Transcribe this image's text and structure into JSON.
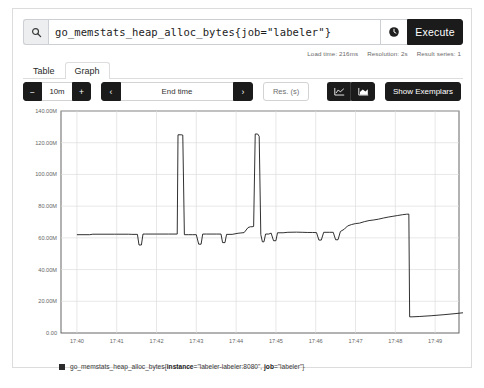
{
  "query_bar": {
    "search_icon": "search-icon",
    "expression": "go_memstats_heap_alloc_bytes{job=\"labeler\"}",
    "placeholder": "Expression (press Shift+Enter for newlines)",
    "history_icon": "history-clock-icon",
    "execute_label": "Execute"
  },
  "meta": {
    "load_time": "Load time: 216ms",
    "resolution": "Resolution: 2s",
    "result_series": "Result series: 1"
  },
  "tabs": [
    {
      "label": "Table",
      "active": false
    },
    {
      "label": "Graph",
      "active": true
    }
  ],
  "controls": {
    "range_decrease": "−",
    "range_value": "10m",
    "range_increase": "+",
    "nav_prev": "‹",
    "end_time": "End time",
    "nav_next": "›",
    "resolution_placeholder": "Res. (s)",
    "resolution_value": "",
    "chart_type_line": "line-chart-icon",
    "chart_type_stacked": "stacked-area-icon",
    "show_exemplars": "Show Exemplars"
  },
  "legend": {
    "metric": "go_memstats_heap_alloc_bytes{",
    "label_instance_key": "instance",
    "label_instance_value": "=\"labeler-labeler:8080\", ",
    "label_job_key": "job",
    "label_job_value": "=\"labeler\"}",
    "color": "#2b2b2b"
  },
  "chart_data": {
    "type": "line",
    "title": "",
    "xlabel": "",
    "ylabel": "",
    "grid": true,
    "legend_position": "bottom",
    "line_color": "#1a1a1a",
    "ylim": [
      0,
      140000000
    ],
    "yticks": [
      0,
      20000000,
      40000000,
      60000000,
      80000000,
      100000000,
      120000000,
      140000000
    ],
    "ytick_labels": [
      "0.00",
      "20.00M",
      "40.00M",
      "60.00M",
      "80.00M",
      "100.00M",
      "120.00M",
      "140.00M"
    ],
    "xlim": [
      "17:39.6",
      "17:49.6"
    ],
    "xticks": [
      "17:40",
      "17:41",
      "17:42",
      "17:43",
      "17:44",
      "17:45",
      "17:46",
      "17:47",
      "17:48",
      "17:49"
    ],
    "series": [
      {
        "name": "go_memstats_heap_alloc_bytes{instance=\"labeler-labeler:8080\", job=\"labeler\"}",
        "points": [
          [
            0.0,
            62000000
          ],
          [
            0.32,
            62000000
          ],
          [
            0.4,
            62300000
          ],
          [
            0.95,
            62300000
          ],
          [
            1.0,
            62300000
          ],
          [
            1.3,
            62300000
          ],
          [
            1.38,
            62200000
          ],
          [
            1.52,
            62200000
          ],
          [
            1.56,
            55500000
          ],
          [
            1.62,
            55500000
          ],
          [
            1.66,
            62400000
          ],
          [
            1.72,
            62400000
          ],
          [
            2.0,
            62400000
          ],
          [
            2.3,
            62400000
          ],
          [
            2.52,
            62400000
          ],
          [
            2.54,
            125000000
          ],
          [
            2.62,
            125000000
          ],
          [
            2.66,
            124800000
          ],
          [
            2.7,
            62000000
          ],
          [
            2.8,
            62000000
          ],
          [
            2.9,
            62000000
          ],
          [
            3.0,
            62000000
          ],
          [
            3.06,
            56000000
          ],
          [
            3.12,
            56000000
          ],
          [
            3.16,
            62400000
          ],
          [
            3.26,
            62400000
          ],
          [
            3.5,
            62400000
          ],
          [
            3.62,
            62400000
          ],
          [
            3.66,
            57000000
          ],
          [
            3.72,
            57000000
          ],
          [
            3.76,
            62200000
          ],
          [
            3.9,
            62200000
          ],
          [
            4.05,
            62900000
          ],
          [
            4.12,
            63100000
          ],
          [
            4.2,
            63300000
          ],
          [
            4.3,
            66500000
          ],
          [
            4.36,
            67000000
          ],
          [
            4.4,
            67000000
          ],
          [
            4.44,
            67200000
          ],
          [
            4.48,
            125500000
          ],
          [
            4.54,
            125500000
          ],
          [
            4.58,
            124000000
          ],
          [
            4.62,
            62100000
          ],
          [
            4.66,
            57500000
          ],
          [
            4.7,
            57500000
          ],
          [
            4.74,
            62400000
          ],
          [
            4.82,
            62400000
          ],
          [
            4.88,
            63000000
          ],
          [
            4.94,
            58200000
          ],
          [
            5.0,
            58200000
          ],
          [
            5.04,
            63200000
          ],
          [
            5.18,
            63200000
          ],
          [
            5.3,
            63500000
          ],
          [
            5.52,
            63600000
          ],
          [
            5.66,
            63500000
          ],
          [
            5.8,
            63400000
          ],
          [
            5.92,
            63400000
          ],
          [
            6.02,
            63300000
          ],
          [
            6.08,
            58600000
          ],
          [
            6.14,
            58600000
          ],
          [
            6.2,
            63500000
          ],
          [
            6.34,
            63500000
          ],
          [
            6.44,
            63500000
          ],
          [
            6.5,
            58800000
          ],
          [
            6.56,
            58800000
          ],
          [
            6.62,
            64000000
          ],
          [
            6.72,
            65500000
          ],
          [
            6.8,
            67500000
          ],
          [
            6.9,
            68400000
          ],
          [
            7.0,
            69000000
          ],
          [
            7.1,
            69300000
          ],
          [
            7.22,
            70200000
          ],
          [
            7.34,
            70900000
          ],
          [
            7.46,
            71300000
          ],
          [
            7.58,
            71800000
          ],
          [
            7.7,
            72500000
          ],
          [
            7.82,
            73100000
          ],
          [
            7.94,
            73600000
          ],
          [
            8.06,
            74100000
          ],
          [
            8.18,
            74600000
          ],
          [
            8.28,
            74900000
          ],
          [
            8.34,
            75000000
          ],
          [
            8.36,
            10200000
          ],
          [
            8.42,
            10200000
          ],
          [
            8.6,
            10400000
          ],
          [
            8.9,
            10900000
          ],
          [
            9.2,
            11500000
          ],
          [
            9.5,
            12200000
          ],
          [
            9.72,
            12800000
          ],
          [
            9.78,
            9000000
          ],
          [
            9.84,
            9000000
          ],
          [
            9.9,
            13200000
          ],
          [
            10.0,
            13400000
          ]
        ]
      }
    ]
  }
}
